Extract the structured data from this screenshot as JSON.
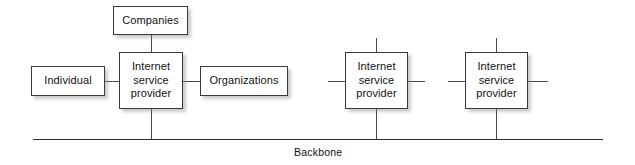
{
  "diagram": {
    "background_color": "#ffffff",
    "box_border_color": "#3a3a3a",
    "line_color": "#4a4a4a",
    "backbone_color": "#2b2b2b",
    "text_color": "#111111"
  },
  "nodes": [
    {
      "id": "companies",
      "label": "Companies",
      "x": 113,
      "y": 6,
      "w": 75,
      "h": 29
    },
    {
      "id": "individual",
      "label": "Individual",
      "x": 31,
      "y": 66,
      "w": 74,
      "h": 30
    },
    {
      "id": "isp-center",
      "label": "Internet\nservice\nprovider",
      "x": 119,
      "y": 52,
      "w": 64,
      "h": 57
    },
    {
      "id": "organizations",
      "label": "Organizations",
      "x": 200,
      "y": 66,
      "w": 88,
      "h": 30
    },
    {
      "id": "isp-2",
      "label": "Internet\nservice\nprovider",
      "x": 345,
      "y": 52,
      "w": 63,
      "h": 57
    },
    {
      "id": "isp-3",
      "label": "Internet\nservice\nprovider",
      "x": 465,
      "y": 52,
      "w": 63,
      "h": 57
    }
  ],
  "connectors": [
    {
      "id": "companies-to-isp-center",
      "type": "v",
      "x": 151,
      "y": 35,
      "len": 17
    },
    {
      "id": "individual-to-isp-center",
      "type": "h",
      "x": 105,
      "y": 81,
      "len": 14
    },
    {
      "id": "isp-center-to-organizations",
      "type": "h",
      "x": 183,
      "y": 81,
      "len": 17
    },
    {
      "id": "isp-center-to-backbone",
      "type": "v",
      "x": 151,
      "y": 109,
      "len": 30
    },
    {
      "id": "isp-2-stub-up",
      "type": "v",
      "x": 376,
      "y": 38,
      "len": 14
    },
    {
      "id": "isp-2-stub-left",
      "type": "h",
      "x": 328,
      "y": 81,
      "len": 17
    },
    {
      "id": "isp-2-stub-right",
      "type": "h",
      "x": 408,
      "y": 81,
      "len": 17
    },
    {
      "id": "isp-2-to-backbone",
      "type": "v",
      "x": 376,
      "y": 109,
      "len": 30
    },
    {
      "id": "isp-3-stub-up",
      "type": "v",
      "x": 496,
      "y": 38,
      "len": 14
    },
    {
      "id": "isp-3-stub-left",
      "type": "h",
      "x": 448,
      "y": 81,
      "len": 17
    },
    {
      "id": "isp-3-stub-right",
      "type": "h",
      "x": 528,
      "y": 81,
      "len": 20
    },
    {
      "id": "isp-3-to-backbone",
      "type": "v",
      "x": 496,
      "y": 109,
      "len": 30
    }
  ],
  "backbone": {
    "label": "Backbone",
    "line_x": 33,
    "line_y": 139,
    "line_len": 570,
    "label_x": 294,
    "label_y": 146
  }
}
